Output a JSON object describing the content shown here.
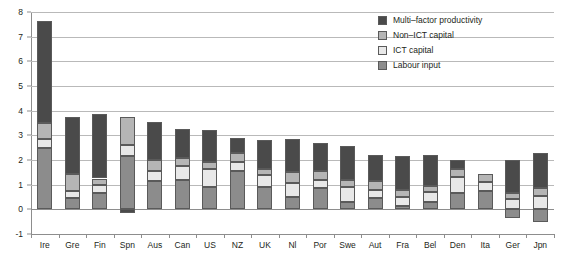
{
  "chart_data": {
    "type": "bar",
    "title": "",
    "subtitle": "",
    "xlabel": "",
    "ylabel": "",
    "stacked": true,
    "grid": true,
    "legend_position": "top-right",
    "ylim": [
      -1,
      8
    ],
    "yticks": [
      -1,
      0,
      1,
      2,
      3,
      4,
      5,
      6,
      7,
      8
    ],
    "ytick_labels": [
      "-1",
      "0",
      "1",
      "2",
      "3",
      "4",
      "5",
      "6",
      "7",
      "8"
    ],
    "categories": [
      "Ire",
      "Gre",
      "Fin",
      "Spn",
      "Aus",
      "Can",
      "US",
      "NZ",
      "UK",
      "Nl",
      "Por",
      "Swe",
      "Aut",
      "Fra",
      "Bel",
      "Den",
      "Ita",
      "Ger",
      "Jpn"
    ],
    "series": [
      {
        "name": "Labour input",
        "color": "#8c8c8c",
        "values": [
          2.5,
          0.45,
          0.65,
          2.15,
          1.15,
          1.2,
          0.9,
          1.55,
          0.9,
          0.5,
          0.85,
          0.3,
          0.45,
          0.15,
          0.3,
          0.65,
          0.75,
          -0.35,
          -0.5
        ]
      },
      {
        "name": "ICT capital",
        "color": "#e8e8e8",
        "values": [
          0.35,
          0.3,
          0.35,
          0.45,
          0.4,
          0.55,
          0.75,
          0.35,
          0.5,
          0.55,
          0.35,
          0.6,
          0.35,
          0.35,
          0.4,
          0.65,
          0.35,
          0.4,
          0.55
        ]
      },
      {
        "name": "Non-ICT capital",
        "color": "#b5b5b5",
        "values": [
          0.65,
          0.7,
          0.25,
          1.15,
          0.45,
          0.35,
          0.25,
          0.4,
          0.25,
          0.45,
          0.35,
          0.3,
          0.35,
          0.3,
          0.25,
          0.35,
          0.35,
          0.25,
          0.3
        ]
      },
      {
        "name": "Multi-factor productivity",
        "color": "#4a4a4a",
        "values": [
          4.15,
          2.3,
          2.6,
          -0.15,
          1.55,
          1.15,
          1.3,
          0.6,
          1.15,
          1.35,
          1.15,
          1.35,
          1.05,
          1.35,
          1.25,
          0.35,
          0.0,
          1.35,
          1.45
        ]
      }
    ],
    "totals": [
      7.65,
      3.75,
      3.85,
      3.75,
      3.55,
      3.25,
      3.2,
      2.9,
      2.8,
      2.85,
      2.7,
      2.55,
      2.2,
      2.15,
      2.2,
      2.0,
      1.45,
      1.65,
      1.8
    ]
  },
  "legend": {
    "items": [
      {
        "label": "Multi–factor productivity",
        "color": "#4a4a4a"
      },
      {
        "label": "Non–ICT capital",
        "color": "#b5b5b5"
      },
      {
        "label": "ICT capital",
        "color": "#e8e8e8"
      },
      {
        "label": "Labour input",
        "color": "#8c8c8c"
      }
    ]
  }
}
